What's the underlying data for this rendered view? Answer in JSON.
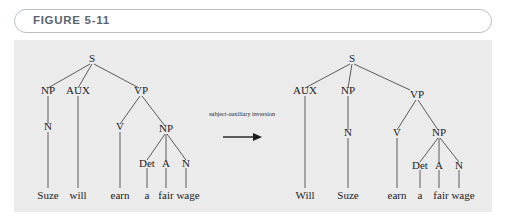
{
  "figure": {
    "label": "FIGURE 5-11",
    "panel_bg": "#ebebeb",
    "header_border": "#b9bfc4",
    "label_color": "#5a6570"
  },
  "transform": {
    "label": "subject-auxiliary inversion",
    "arrow": "arrow-right"
  },
  "trees": {
    "left": {
      "name": "declarative-tree",
      "sentence": "Suze will earn a fair wage",
      "nodes": {
        "s": "S",
        "np1": "NP",
        "aux": "AUX",
        "vp": "VP",
        "n1": "N",
        "v": "V",
        "np2": "NP",
        "det": "Det",
        "a": "A",
        "n2": "N"
      },
      "leaves": {
        "suze": "Suze",
        "will": "will",
        "earn": "earn",
        "a": "a",
        "fair": "fair",
        "wage": "wage"
      }
    },
    "right": {
      "name": "interrogative-tree",
      "sentence": "Will Suze earn a fair wage",
      "nodes": {
        "s": "S",
        "aux": "AUX",
        "np1": "NP",
        "vp": "VP",
        "n1": "N",
        "v": "V",
        "np2": "NP",
        "det": "Det",
        "a": "A",
        "n2": "N"
      },
      "leaves": {
        "will": "Will",
        "suze": "Suze",
        "earn": "earn",
        "a": "a",
        "fair": "fair",
        "wage": "wage"
      }
    }
  }
}
